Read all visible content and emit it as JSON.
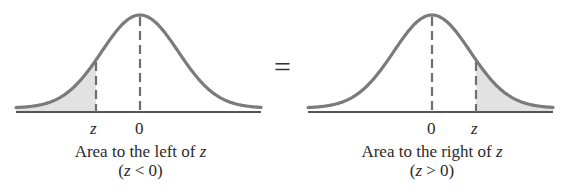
{
  "colors": {
    "curve": "#7b7b7b",
    "shade": "#e2e2e2",
    "baseline": "#555555",
    "dash": "#6e6e6e",
    "text": "#2a2a2a"
  },
  "equals_sign": "=",
  "left_panel": {
    "tick_z": "z",
    "tick_zero": "0",
    "caption_prefix": "Area to the left of ",
    "caption_var": "z",
    "condition_open": "(",
    "condition_var": "z",
    "condition_rest": " < 0)",
    "shaded_region": "left tail, x < z",
    "geometry": {
      "x_start": 16,
      "x_end": 261,
      "peak_x": 140,
      "z_x": 96,
      "baseline_y": 112,
      "peak_y": 15
    }
  },
  "right_panel": {
    "tick_zero": "0",
    "tick_z": "z",
    "caption_prefix": "Area to the right of ",
    "caption_var": "z",
    "condition_open": "(",
    "condition_var": "z",
    "condition_rest": " > 0)",
    "shaded_region": "right tail, x > z",
    "geometry": {
      "x_start": 308,
      "x_end": 553,
      "peak_x": 432,
      "z_x": 476,
      "baseline_y": 112,
      "peak_y": 15
    }
  }
}
